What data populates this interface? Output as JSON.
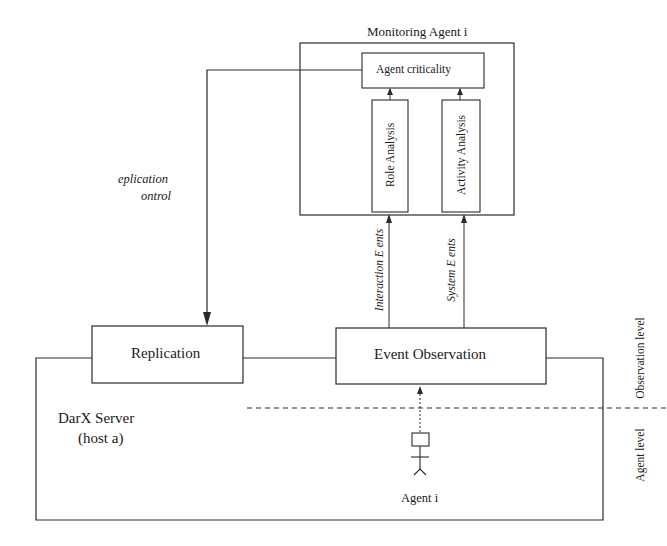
{
  "diagram": {
    "monitoring_agent": {
      "title": "Monitoring Agent i",
      "criticality": "Agent criticality",
      "role_analysis": "Role Analysis",
      "activity_analysis": "Activity Analysis"
    },
    "replication_control": {
      "line1": "eplication",
      "line2": "ontrol"
    },
    "event_streams": {
      "interaction": "Interaction E ents",
      "system": "System E ents"
    },
    "server": {
      "replication": "Replication",
      "event_observation": "Event Observation",
      "name": "DarX Server",
      "host": "(host a)"
    },
    "agent": {
      "label": "Agent i"
    },
    "levels": {
      "observation": "Observation level",
      "agent": "Agent level"
    },
    "colors": {
      "stroke": "#2a2a2a",
      "text": "#1a1a1a",
      "background": "#ffffff"
    }
  }
}
